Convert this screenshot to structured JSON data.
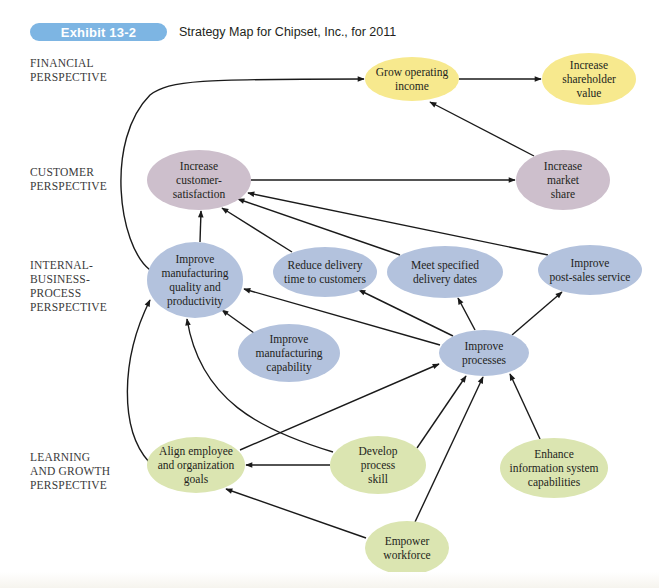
{
  "header": {
    "exhibit_label": "Exhibit 13-2",
    "title": "Strategy Map for Chipset, Inc., for 2011"
  },
  "colors": {
    "exhibit_badge": "#7db5e3",
    "financial": "#f7e98e",
    "customer": "#cdbfcc",
    "internal": "#b3c2dd",
    "learning": "#dbe5b1",
    "arrow": "#1a1a1a"
  },
  "perspectives": [
    {
      "id": "financial",
      "label": "FINANCIAL\nPERSPECTIVE",
      "top": 56
    },
    {
      "id": "customer",
      "label": "CUSTOMER\nPERSPECTIVE",
      "top": 165
    },
    {
      "id": "internal",
      "label": "INTERNAL-\nBUSINESS-\nPROCESS\nPERSPECTIVE",
      "top": 258
    },
    {
      "id": "learning",
      "label": "LEARNING\nAND GROWTH\nPERSPECTIVE",
      "top": 450
    }
  ],
  "nodes": [
    {
      "id": "grow-operating-income",
      "perspective": "financial",
      "lines": [
        "Grow operating",
        "income"
      ],
      "cx": 412,
      "cy": 79,
      "rx": 47,
      "ry": 22
    },
    {
      "id": "increase-shareholder-value",
      "perspective": "financial",
      "lines": [
        "Increase",
        "shareholder",
        "value"
      ],
      "cx": 589,
      "cy": 79,
      "rx": 47,
      "ry": 26
    },
    {
      "id": "increase-customer-satisfaction",
      "perspective": "customer",
      "lines": [
        "Increase",
        "customer-",
        "satisfaction"
      ],
      "cx": 199,
      "cy": 180,
      "rx": 52,
      "ry": 30
    },
    {
      "id": "increase-market-share",
      "perspective": "customer",
      "lines": [
        "Increase",
        "market",
        "share"
      ],
      "cx": 563,
      "cy": 180,
      "rx": 47,
      "ry": 30
    },
    {
      "id": "improve-manufacturing-quality",
      "perspective": "internal",
      "lines": [
        "Improve",
        "manufacturing",
        "quality and",
        "productivity"
      ],
      "cx": 195,
      "cy": 280,
      "rx": 48,
      "ry": 38
    },
    {
      "id": "reduce-delivery-time",
      "perspective": "internal",
      "lines": [
        "Reduce delivery",
        "time to customers"
      ],
      "cx": 325,
      "cy": 272,
      "rx": 52,
      "ry": 25
    },
    {
      "id": "meet-delivery-dates",
      "perspective": "internal",
      "lines": [
        "Meet specified",
        "delivery dates"
      ],
      "cx": 445,
      "cy": 272,
      "rx": 58,
      "ry": 26
    },
    {
      "id": "improve-post-sales-service",
      "perspective": "internal",
      "lines": [
        "Improve",
        "post-sales service"
      ],
      "cx": 590,
      "cy": 270,
      "rx": 52,
      "ry": 25
    },
    {
      "id": "improve-manufacturing-capability",
      "perspective": "internal",
      "lines": [
        "Improve",
        "manufacturing",
        "capability"
      ],
      "cx": 289,
      "cy": 353,
      "rx": 51,
      "ry": 29
    },
    {
      "id": "improve-processes",
      "perspective": "internal",
      "lines": [
        "Improve",
        "processes"
      ],
      "cx": 484,
      "cy": 353,
      "rx": 45,
      "ry": 23
    },
    {
      "id": "align-employee-goals",
      "perspective": "learning",
      "lines": [
        "Align employee",
        "and organization",
        "goals"
      ],
      "cx": 196,
      "cy": 465,
      "rx": 49,
      "ry": 28
    },
    {
      "id": "develop-process-skill",
      "perspective": "learning",
      "lines": [
        "Develop",
        "process",
        "skill"
      ],
      "cx": 378,
      "cy": 465,
      "rx": 48,
      "ry": 29
    },
    {
      "id": "enhance-information-system",
      "perspective": "learning",
      "lines": [
        "Enhance",
        "information system",
        "capabilities"
      ],
      "cx": 554,
      "cy": 468,
      "rx": 54,
      "ry": 30
    },
    {
      "id": "empower-workforce",
      "perspective": "learning",
      "lines": [
        "Empower",
        "workforce"
      ],
      "cx": 407,
      "cy": 548,
      "rx": 42,
      "ry": 27
    }
  ],
  "edges": [
    {
      "from": "grow-operating-income",
      "to": "increase-shareholder-value",
      "d": "M459,79 L541,79"
    },
    {
      "from": "increase-market-share",
      "to": "grow-operating-income",
      "d": "M534,156 L430,102"
    },
    {
      "from": "increase-customer-satisfaction",
      "to": "increase-market-share",
      "d": "M251,180 L515,180"
    },
    {
      "from": "improve-manufacturing-quality",
      "to": "grow-operating-income",
      "d": "M150,270 C118,245 105,140 150,95 C170,80 200,79 364,79"
    },
    {
      "from": "improve-manufacturing-quality",
      "to": "increase-customer-satisfaction",
      "d": "M200,242 L201,211"
    },
    {
      "from": "reduce-delivery-time",
      "to": "increase-customer-satisfaction",
      "d": "M292,252 L222,208"
    },
    {
      "from": "meet-delivery-dates",
      "to": "increase-customer-satisfaction",
      "d": "M400,255 L238,199"
    },
    {
      "from": "improve-post-sales-service",
      "to": "increase-customer-satisfaction",
      "d": "M548,255 L248,193"
    },
    {
      "from": "improve-manufacturing-capability",
      "to": "improve-manufacturing-quality",
      "d": "M254,333 L222,310"
    },
    {
      "from": "improve-processes",
      "to": "improve-manufacturing-quality",
      "d": "M440,345 L244,289"
    },
    {
      "from": "improve-processes",
      "to": "reduce-delivery-time",
      "d": "M453,336 L359,290"
    },
    {
      "from": "improve-processes",
      "to": "meet-delivery-dates",
      "d": "M475,330 L458,298"
    },
    {
      "from": "improve-processes",
      "to": "improve-post-sales-service",
      "d": "M512,335 L562,292"
    },
    {
      "from": "align-employee-goals",
      "to": "improve-manufacturing-quality",
      "d": "M149,462 C120,430 120,360 150,300"
    },
    {
      "from": "align-employee-goals",
      "to": "improve-processes",
      "d": "M240,450 L439,364"
    },
    {
      "from": "develop-process-skill",
      "to": "align-employee-goals",
      "d": "M330,465 L246,465"
    },
    {
      "from": "develop-process-skill",
      "to": "improve-manufacturing-quality",
      "d": "M333,452 C260,430 200,400 187,319"
    },
    {
      "from": "develop-process-skill",
      "to": "improve-processes",
      "d": "M417,448 L466,376"
    },
    {
      "from": "enhance-information-system",
      "to": "improve-processes",
      "d": "M540,439 L510,374"
    },
    {
      "from": "empower-workforce",
      "to": "align-employee-goals",
      "d": "M366,538 L226,489"
    },
    {
      "from": "empower-workforce",
      "to": "improve-processes",
      "d": "M415,522 L483,377"
    }
  ]
}
